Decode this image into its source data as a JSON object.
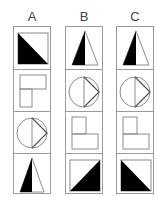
{
  "columns": [
    {
      "label": "A",
      "cells": [
        {
          "figure": "square-black-triangle-bottom-left"
        },
        {
          "figure": "wide-top-rect-with-narrow-bottom-left-rect"
        },
        {
          "figure": "circle-vertical-line-chevron-right"
        },
        {
          "figure": "tall-triangle-left-half-black"
        }
      ]
    },
    {
      "label": "B",
      "cells": [
        {
          "figure": "tall-triangle-left-half-black"
        },
        {
          "figure": "circle-vertical-line-chevron-right"
        },
        {
          "figure": "small-top-left-rect-with-wide-bottom-rect"
        },
        {
          "figure": "square-black-triangle-bottom-right"
        }
      ]
    },
    {
      "label": "C",
      "cells": [
        {
          "figure": "tall-triangle-left-half-black"
        },
        {
          "figure": "circle-vertical-line-chevron-right"
        },
        {
          "figure": "small-top-left-rect-with-wide-bottom-rect"
        },
        {
          "figure": "square-black-triangle-bottom-left"
        }
      ]
    }
  ],
  "colors": {
    "stroke": "#8c8c8c",
    "fill": "#000000",
    "border": "#9a9a9a",
    "label": "#444444"
  }
}
